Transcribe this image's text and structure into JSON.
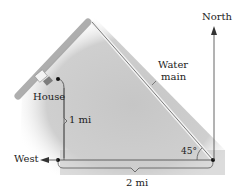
{
  "labels": {
    "north": "North",
    "west": "West",
    "house": "House",
    "water_main_line1": "Water",
    "water_main_line2": "main",
    "vertical_distance": "1 mi",
    "horizontal_distance": "2 mi",
    "angle": "45°"
  },
  "geometry": {
    "house_to_corner_distance_mi": 1,
    "corner_to_water_main_distance_mi": 2,
    "angle_deg": 45
  },
  "colors": {
    "ground": "#c8c8c8",
    "line": "#555555",
    "water_main": "#8a8a8a",
    "dot": "#111111"
  }
}
